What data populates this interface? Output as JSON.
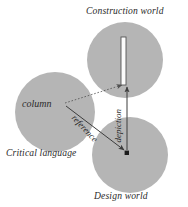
{
  "diagram": {
    "title_labels": {
      "construction_world": "Construction world",
      "design_world": "Design world",
      "critical_language": "Critical language"
    },
    "nodes": {
      "column_term": "column"
    },
    "edges": {
      "reference": "reference",
      "depiction": "depiction"
    },
    "icons": {
      "column_artifact": "column-pillar-icon",
      "design_point": "point-marker-icon"
    },
    "colors": {
      "circle_fill": "#b5b5b5",
      "line": "#4a4a4a",
      "text": "#2b2b2b",
      "background": "#ffffff",
      "column_fill": "#fbfbfb",
      "column_stroke": "#555555"
    },
    "geometry": {
      "circle_critical_language": {
        "cx": 55,
        "cy": 112,
        "r": 40
      },
      "circle_construction_world": {
        "cx": 125,
        "cy": 60,
        "r": 38
      },
      "circle_design_world": {
        "cx": 130,
        "cy": 155,
        "r": 38
      },
      "column_rect": {
        "x": 121,
        "y": 37,
        "w": 5,
        "h": 48
      },
      "design_point": {
        "x": 127,
        "y": 153
      }
    }
  }
}
